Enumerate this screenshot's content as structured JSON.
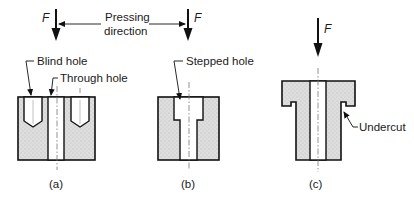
{
  "figure": {
    "force_symbol": "F",
    "pressing_direction_label_line1": "Pressing",
    "pressing_direction_label_line2": "direction",
    "panels": [
      {
        "caption": "(a)",
        "labels": [
          "Blind hole",
          "Through hole"
        ]
      },
      {
        "caption": "(b)",
        "labels": [
          "Stepped hole"
        ]
      },
      {
        "caption": "(c)",
        "labels": [
          "Undercut"
        ]
      }
    ]
  },
  "colors": {
    "outline": "#111111",
    "fill_stipple": "#d9d9d9",
    "background": "#ffffff"
  }
}
